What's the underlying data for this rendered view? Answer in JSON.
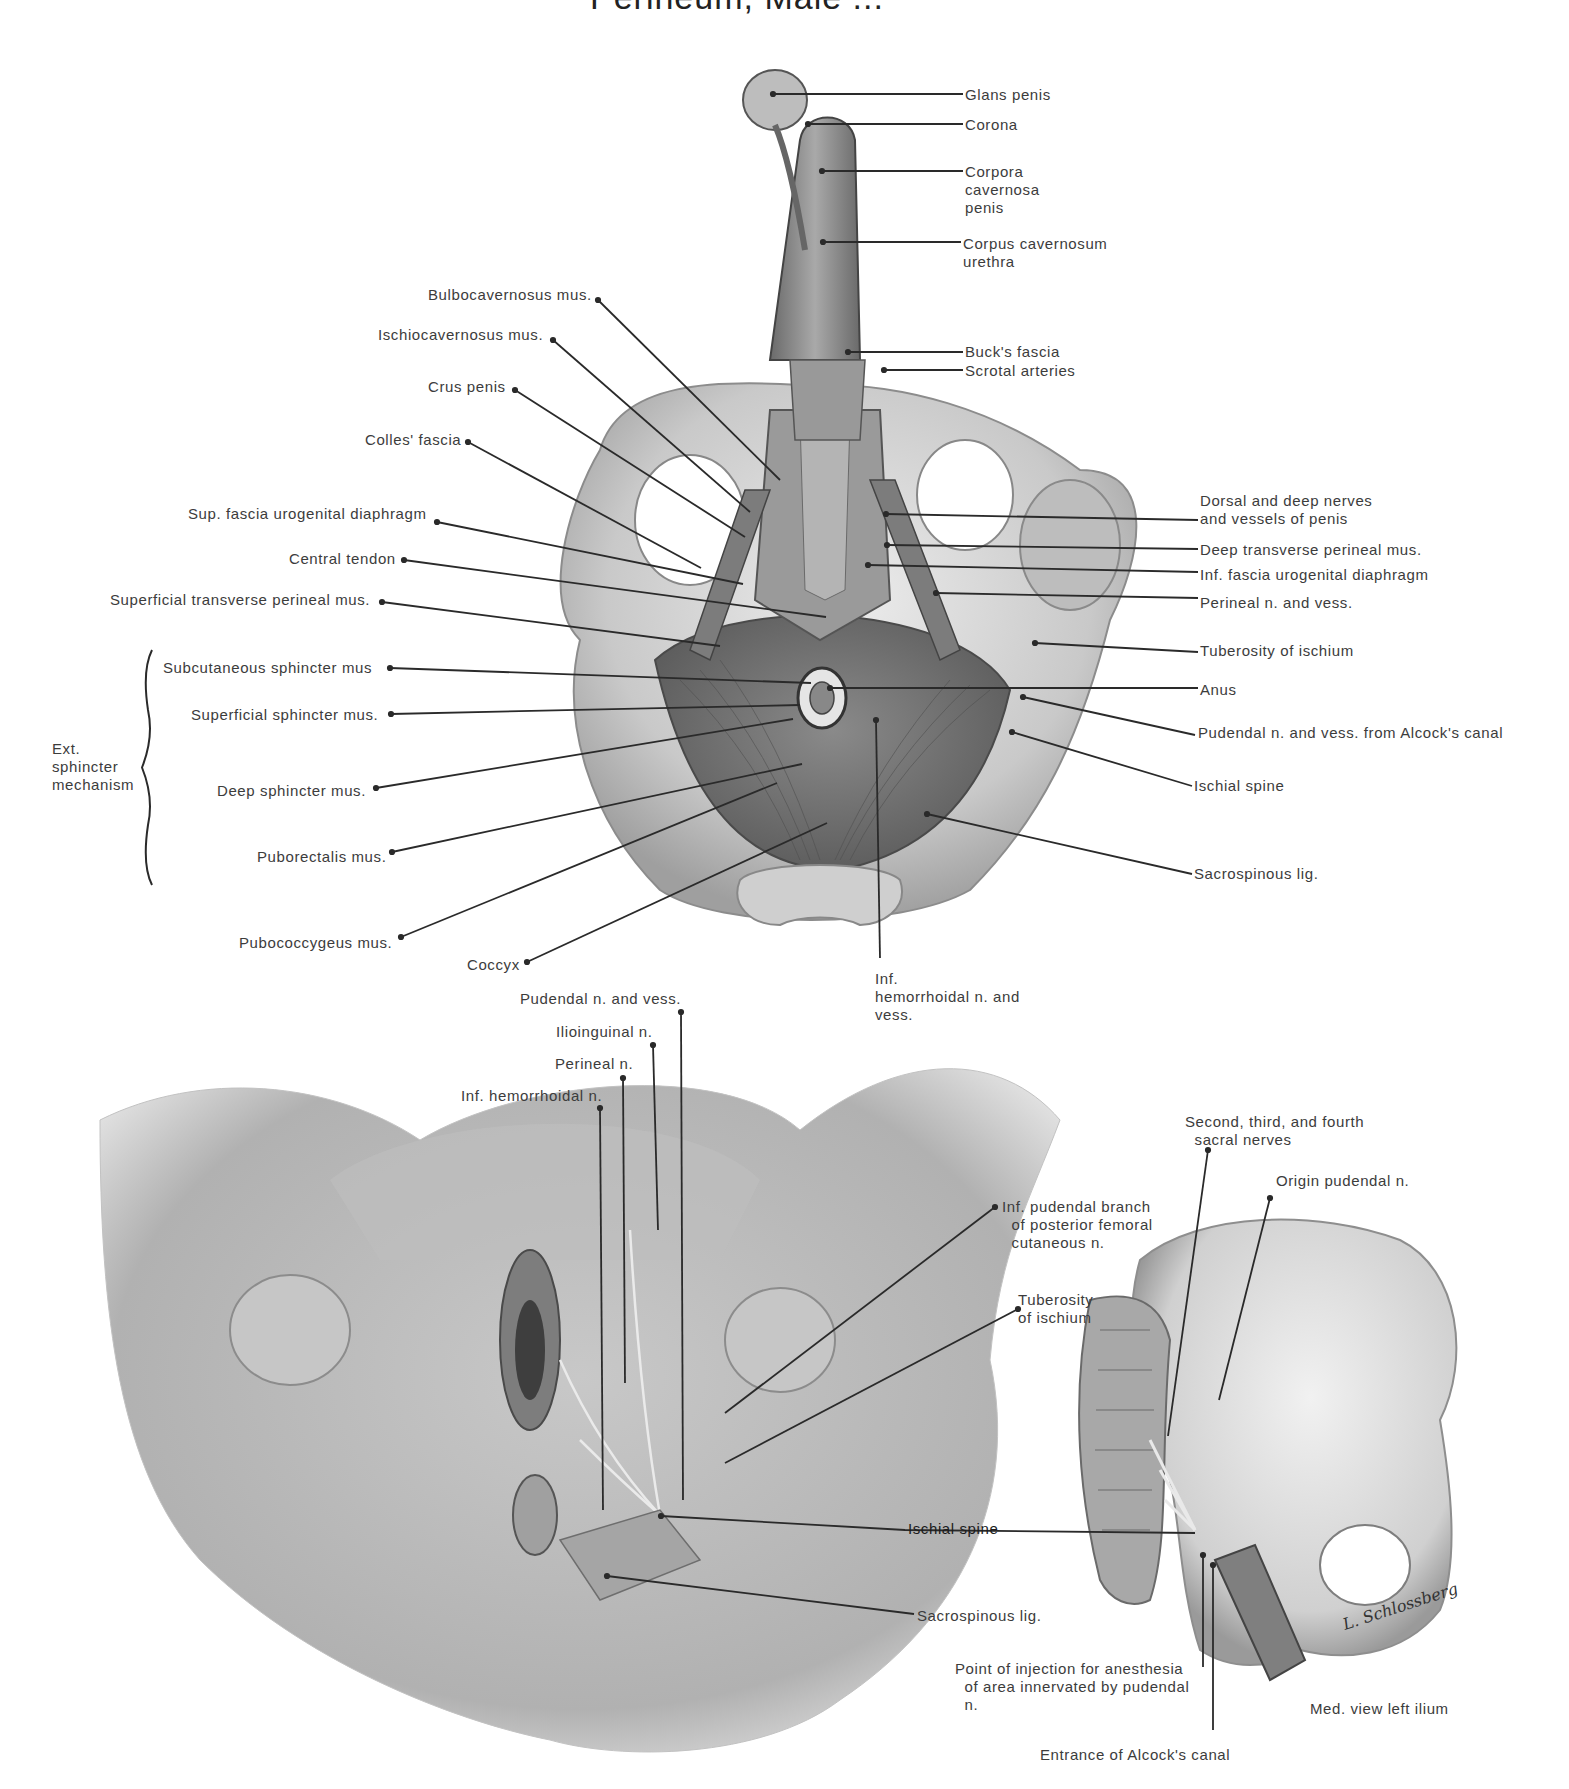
{
  "figure": {
    "title_fragment": "Perineum, Male ...",
    "signature": "L. Schlossberg",
    "panels": {
      "top": "Male perineum, inferior view (dissection)",
      "bottom_left": "Female perineum, pudendal nerve block view",
      "bottom_right": "Med. view left ilium"
    }
  },
  "colors": {
    "background": "#ffffff",
    "label_text": "#3c3c3c",
    "leader_line": "#2a2a2a",
    "bone_light": "#d9d9d9",
    "bone_mid": "#b8b8b8",
    "muscle_dark": "#6e6e6e",
    "skin_light": "#dcdcdc"
  },
  "top_labels_left": [
    {
      "text": "Bulbocavernosus mus.",
      "x": 428,
      "y": 286,
      "line": [
        [
          598,
          300
        ],
        [
          780,
          480
        ]
      ]
    },
    {
      "text": "Ischiocavernosus mus.",
      "x": 378,
      "y": 326,
      "line": [
        [
          553,
          340
        ],
        [
          750,
          512
        ]
      ]
    },
    {
      "text": "Crus penis",
      "x": 428,
      "y": 378,
      "line": [
        [
          515,
          390
        ],
        [
          745,
          537
        ]
      ]
    },
    {
      "text": "Colles' fascia",
      "x": 365,
      "y": 431,
      "line": [
        [
          468,
          442
        ],
        [
          701,
          568
        ]
      ]
    },
    {
      "text": "Sup. fascia urogenital diaphragm",
      "x": 188,
      "y": 505,
      "line": [
        [
          437,
          522
        ],
        [
          743,
          584
        ]
      ]
    },
    {
      "text": "Central tendon",
      "x": 289,
      "y": 550,
      "line": [
        [
          404,
          560
        ],
        [
          826,
          617
        ]
      ]
    },
    {
      "text": "Superficial transverse perineal mus.",
      "x": 110,
      "y": 591,
      "line": [
        [
          382,
          602
        ],
        [
          720,
          646
        ]
      ]
    },
    {
      "text": "Subcutaneous sphincter mus",
      "x": 163,
      "y": 659,
      "line": [
        [
          390,
          668
        ],
        [
          811,
          683
        ]
      ]
    },
    {
      "text": "Superficial sphincter mus.",
      "x": 191,
      "y": 706,
      "line": [
        [
          391,
          714
        ],
        [
          800,
          705
        ]
      ]
    },
    {
      "text": "Deep sphincter mus.",
      "x": 217,
      "y": 782,
      "line": [
        [
          376,
          788
        ],
        [
          793,
          719
        ]
      ]
    },
    {
      "text": "Puborectalis mus.",
      "x": 257,
      "y": 848,
      "line": [
        [
          392,
          852
        ],
        [
          802,
          764
        ]
      ]
    },
    {
      "text": "Pubococcygeus mus.",
      "x": 239,
      "y": 934,
      "line": [
        [
          401,
          937
        ],
        [
          777,
          783
        ]
      ]
    },
    {
      "text": "Coccyx",
      "x": 467,
      "y": 956,
      "line": [
        [
          527,
          962
        ],
        [
          827,
          823
        ]
      ]
    }
  ],
  "top_labels_right": [
    {
      "text": "Glans penis",
      "x": 965,
      "y": 86,
      "line": [
        [
          773,
          94
        ],
        [
          963,
          94
        ]
      ]
    },
    {
      "text": "Corona",
      "x": 965,
      "y": 116,
      "line": [
        [
          808,
          124
        ],
        [
          963,
          124
        ]
      ]
    },
    {
      "text": "Corpora\ncavernosa\npenis",
      "x": 965,
      "y": 163,
      "line": [
        [
          822,
          171
        ],
        [
          963,
          171
        ]
      ]
    },
    {
      "text": "Corpus cavernosum\nurethra",
      "x": 963,
      "y": 235,
      "line": [
        [
          823,
          242
        ],
        [
          961,
          242
        ]
      ]
    },
    {
      "text": "Buck's fascia",
      "x": 965,
      "y": 343,
      "line": [
        [
          848,
          352
        ],
        [
          963,
          352
        ]
      ]
    },
    {
      "text": "Scrotal arteries",
      "x": 965,
      "y": 362,
      "line": [
        [
          884,
          370
        ],
        [
          963,
          370
        ]
      ]
    },
    {
      "text": "Dorsal and deep nerves\nand vessels of penis",
      "x": 1200,
      "y": 492,
      "line": [
        [
          886,
          514
        ],
        [
          1198,
          520
        ]
      ]
    },
    {
      "text": "Deep transverse perineal mus.",
      "x": 1200,
      "y": 541,
      "line": [
        [
          887,
          545
        ],
        [
          1198,
          549
        ]
      ]
    },
    {
      "text": "Inf. fascia urogenital diaphragm",
      "x": 1200,
      "y": 566,
      "line": [
        [
          868,
          565
        ],
        [
          1198,
          572
        ]
      ]
    },
    {
      "text": "Perineal n. and vess.",
      "x": 1200,
      "y": 594,
      "line": [
        [
          936,
          593
        ],
        [
          1198,
          598
        ]
      ]
    },
    {
      "text": "Tuberosity of ischium",
      "x": 1200,
      "y": 642,
      "line": [
        [
          1035,
          643
        ],
        [
          1198,
          652
        ]
      ]
    },
    {
      "text": "Anus",
      "x": 1200,
      "y": 681,
      "line": [
        [
          830,
          688
        ],
        [
          1198,
          688
        ]
      ]
    },
    {
      "text": "Pudendal n. and vess. from Alcock's canal",
      "x": 1198,
      "y": 724,
      "line": [
        [
          1023,
          697
        ],
        [
          1195,
          735
        ]
      ]
    },
    {
      "text": "Ischial spine",
      "x": 1194,
      "y": 777,
      "line": [
        [
          1012,
          732
        ],
        [
          1192,
          786
        ]
      ]
    },
    {
      "text": "Sacrospinous lig.",
      "x": 1194,
      "y": 865,
      "line": [
        [
          927,
          814
        ],
        [
          1192,
          874
        ]
      ]
    },
    {
      "text": "Inf.\nhemorrhoidal n. and\nvess.",
      "x": 875,
      "y": 970,
      "line": [
        [
          876,
          720
        ],
        [
          880,
          958
        ]
      ]
    }
  ],
  "bracket": {
    "label": "Ext.\nsphincter\nmechanism",
    "label_x": 52,
    "label_y": 740,
    "x": 148,
    "y_top": 650,
    "y_bottom": 885
  },
  "bottom_labels": [
    {
      "text": "Pudendal n. and vess.",
      "x": 520,
      "y": 990,
      "line": [
        [
          681,
          1012
        ],
        [
          683,
          1500
        ]
      ]
    },
    {
      "text": "Ilioinguinal n.",
      "x": 556,
      "y": 1023,
      "line": [
        [
          653,
          1045
        ],
        [
          658,
          1230
        ]
      ]
    },
    {
      "text": "Perineal n.",
      "x": 555,
      "y": 1055,
      "line": [
        [
          623,
          1078
        ],
        [
          625,
          1383
        ]
      ]
    },
    {
      "text": "Inf. hemorrhoidal n.",
      "x": 461,
      "y": 1087,
      "line": [
        [
          600,
          1108
        ],
        [
          603,
          1510
        ]
      ]
    },
    {
      "text": "Inf. pudendal branch\n  of posterior femoral\n  cutaneous n.",
      "x": 1002,
      "y": 1198,
      "line": [
        [
          995,
          1207
        ],
        [
          725,
          1413
        ]
      ]
    },
    {
      "text": "Tuberosity\nof ischium",
      "x": 1018,
      "y": 1291,
      "line": [
        [
          1018,
          1309
        ],
        [
          725,
          1463
        ]
      ]
    },
    {
      "text": "Ischial spine",
      "x": 908,
      "y": 1520,
      "line": [
        [
          661,
          1516
        ],
        [
          905,
          1530
        ],
        [
          1195,
          1533
        ]
      ],
      "bold": true
    },
    {
      "text": "Sacrospinous lig.",
      "x": 917,
      "y": 1607,
      "line": [
        [
          607,
          1576
        ],
        [
          914,
          1614
        ]
      ]
    },
    {
      "text": "Second, third, and fourth\n  sacral nerves",
      "x": 1185,
      "y": 1113,
      "line": [
        [
          1208,
          1150
        ],
        [
          1168,
          1436
        ]
      ]
    },
    {
      "text": "Origin pudendal n.",
      "x": 1276,
      "y": 1172,
      "line": [
        [
          1270,
          1198
        ],
        [
          1219,
          1400
        ]
      ]
    },
    {
      "text": "Point of injection for anesthesia\n  of area innervated by pudendal\n  n.",
      "x": 955,
      "y": 1660,
      "line": [
        [
          1203,
          1555
        ],
        [
          1203,
          1667
        ]
      ]
    },
    {
      "text": "Entrance of Alcock's canal",
      "x": 1040,
      "y": 1746,
      "line": [
        [
          1213,
          1565
        ],
        [
          1213,
          1730
        ]
      ]
    },
    {
      "text": "Med. view left ilium",
      "x": 1310,
      "y": 1700,
      "line": null
    }
  ]
}
